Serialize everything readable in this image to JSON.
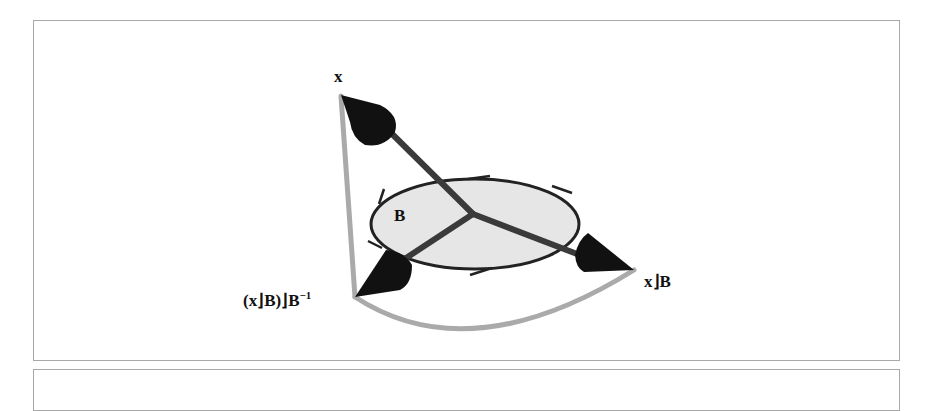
{
  "figure": {
    "labels": {
      "x": "x",
      "bivector": "B",
      "contraction": "x⌋B",
      "projection_base": "(x⌋B)⌋B",
      "projection_exp": "−1"
    },
    "colors": {
      "vector": "#3a3a3a",
      "arrowhead": "#111111",
      "arc": "#aaaaaa",
      "disk_fill": "#e6e6e6",
      "disk_stroke": "#222222",
      "frame": "#a8a8a8"
    }
  }
}
